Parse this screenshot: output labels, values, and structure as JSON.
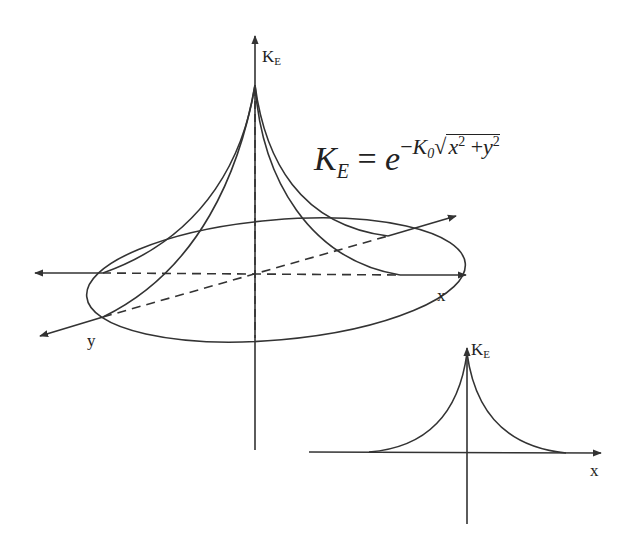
{
  "diagram": {
    "equation": {
      "lhs": "K",
      "lhs_sub": "E",
      "equals": "=",
      "base": "e",
      "exp_sign": "−",
      "exp_coef": "K",
      "exp_coef_sub": "0",
      "radicand_x": "x",
      "radicand_plus": "+",
      "radicand_y": "y",
      "power": "2",
      "full_text": "K_E = e^{-K_0 sqrt(x^2 + y^2)}"
    },
    "main_3d_plot": {
      "vertical_axis_label": "K",
      "vertical_axis_label_sub": "E",
      "x_axis_label": "x",
      "y_axis_label": "y",
      "features": [
        "peaked exponential surface",
        "elliptical base contour",
        "dashed hidden axes"
      ]
    },
    "inset_2d_plot": {
      "vertical_axis_label": "K",
      "vertical_axis_label_sub": "E",
      "x_axis_label": "x",
      "features": [
        "cusp-shaped decaying curve symmetric about vertical axis"
      ]
    },
    "colors": {
      "stroke": "#333333",
      "background": "#ffffff"
    }
  }
}
